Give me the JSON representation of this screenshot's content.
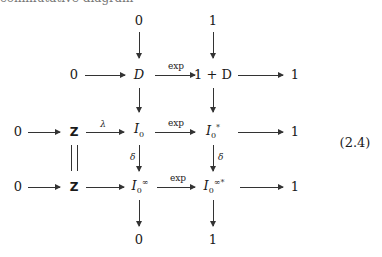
{
  "cut_text": "commutative diagram",
  "diagram": {
    "equation_number": "(2.4)",
    "top_row": [
      "0",
      "1"
    ],
    "row1": {
      "left": "0",
      "mid": "D",
      "mid_right": "1 + D",
      "right": "1",
      "arrow_label": "exp"
    },
    "row2": {
      "left": "0",
      "z": "Z",
      "lambda": "λ",
      "mid": "I",
      "mid_sub": "0",
      "mid_right": "I",
      "mid_right_sub": "0",
      "mid_right_sup": "*",
      "right": "1",
      "arrow_label": "exp"
    },
    "row3": {
      "left": "0",
      "z": "Z",
      "mid": "I",
      "mid_sub": "0",
      "mid_sup": "∞",
      "mid_right": "I",
      "mid_right_sub": "0",
      "mid_right_sup": "∞*",
      "right": "1",
      "arrow_label": "exp"
    },
    "delta_label": "δ",
    "bottom_row": [
      "0",
      "1"
    ]
  }
}
